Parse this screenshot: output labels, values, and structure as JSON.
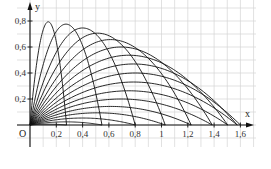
{
  "chart_data": {
    "type": "line",
    "title": "",
    "xlabel": "x",
    "ylabel": "y",
    "origin_label": "O",
    "xlim": [
      0,
      1.72
    ],
    "ylim": [
      0,
      0.92
    ],
    "grid": true,
    "grid_step": 0.1,
    "x_ticks": [
      0.2,
      0.4,
      0.6,
      0.8,
      1,
      1.2,
      1.4,
      1.6
    ],
    "x_tick_labels": [
      "0,2",
      "0,4",
      "0,6",
      "0,8",
      "1",
      "1,2",
      "1,4",
      "1,6"
    ],
    "y_ticks": [
      0.2,
      0.4,
      0.6,
      0.8
    ],
    "y_tick_labels": [
      "0,2",
      "0,4",
      "0,6",
      "0,8"
    ],
    "parameters": {
      "v2_over_g": 1.6
    },
    "series": [
      {
        "name": "θ=5°",
        "angle_deg": 5,
        "range": 0.278,
        "max_height": 0.006
      },
      {
        "name": "θ=10°",
        "angle_deg": 10,
        "range": 0.547,
        "max_height": 0.024
      },
      {
        "name": "θ=15°",
        "angle_deg": 15,
        "range": 0.8,
        "max_height": 0.054
      },
      {
        "name": "θ=20°",
        "angle_deg": 20,
        "range": 1.028,
        "max_height": 0.094
      },
      {
        "name": "θ=25°",
        "angle_deg": 25,
        "range": 1.226,
        "max_height": 0.143
      },
      {
        "name": "θ=30°",
        "angle_deg": 30,
        "range": 1.386,
        "max_height": 0.2
      },
      {
        "name": "θ=35°",
        "angle_deg": 35,
        "range": 1.504,
        "max_height": 0.263
      },
      {
        "name": "θ=40°",
        "angle_deg": 40,
        "range": 1.576,
        "max_height": 0.331
      },
      {
        "name": "θ=45°",
        "angle_deg": 45,
        "range": 1.6,
        "max_height": 0.4
      },
      {
        "name": "θ=50°",
        "angle_deg": 50,
        "range": 1.576,
        "max_height": 0.469
      },
      {
        "name": "θ=55°",
        "angle_deg": 55,
        "range": 1.504,
        "max_height": 0.537
      },
      {
        "name": "θ=60°",
        "angle_deg": 60,
        "range": 1.386,
        "max_height": 0.6
      },
      {
        "name": "θ=65°",
        "angle_deg": 65,
        "range": 1.226,
        "max_height": 0.657
      },
      {
        "name": "θ=70°",
        "angle_deg": 70,
        "range": 1.028,
        "max_height": 0.706
      },
      {
        "name": "θ=75°",
        "angle_deg": 75,
        "range": 0.8,
        "max_height": 0.746
      },
      {
        "name": "θ=80°",
        "angle_deg": 80,
        "range": 0.547,
        "max_height": 0.776
      },
      {
        "name": "θ=85°",
        "angle_deg": 85,
        "range": 0.278,
        "max_height": 0.794
      }
    ],
    "colors": {
      "curve": "#111111",
      "axis": "#111111",
      "grid": "#d4d4d4"
    }
  }
}
